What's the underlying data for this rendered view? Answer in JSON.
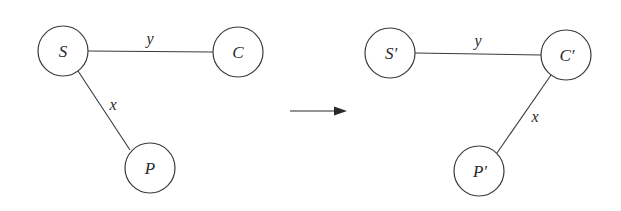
{
  "diagram": {
    "type": "graph-transformation",
    "before": {
      "nodes": [
        {
          "id": "S",
          "label": "S",
          "cx": 63,
          "cy": 51,
          "r": 25
        },
        {
          "id": "C",
          "label": "C",
          "cx": 238,
          "cy": 52,
          "r": 25
        },
        {
          "id": "P",
          "label": "P",
          "cx": 150,
          "cy": 168,
          "r": 25
        }
      ],
      "edges": [
        {
          "from": "S",
          "to": "C",
          "label": "y"
        },
        {
          "from": "S",
          "to": "P",
          "label": "x"
        }
      ]
    },
    "arrow": {
      "label": "",
      "direction": "right"
    },
    "after": {
      "nodes": [
        {
          "id": "S'",
          "label": "S′",
          "cx": 390,
          "cy": 53,
          "r": 25
        },
        {
          "id": "C'",
          "label": "C′",
          "cx": 566,
          "cy": 55,
          "r": 25
        },
        {
          "id": "P'",
          "label": "P′",
          "cx": 479,
          "cy": 171,
          "r": 25
        }
      ],
      "edges": [
        {
          "from": "S'",
          "to": "C'",
          "label": "y"
        },
        {
          "from": "C'",
          "to": "P'",
          "label": "x"
        }
      ]
    }
  }
}
